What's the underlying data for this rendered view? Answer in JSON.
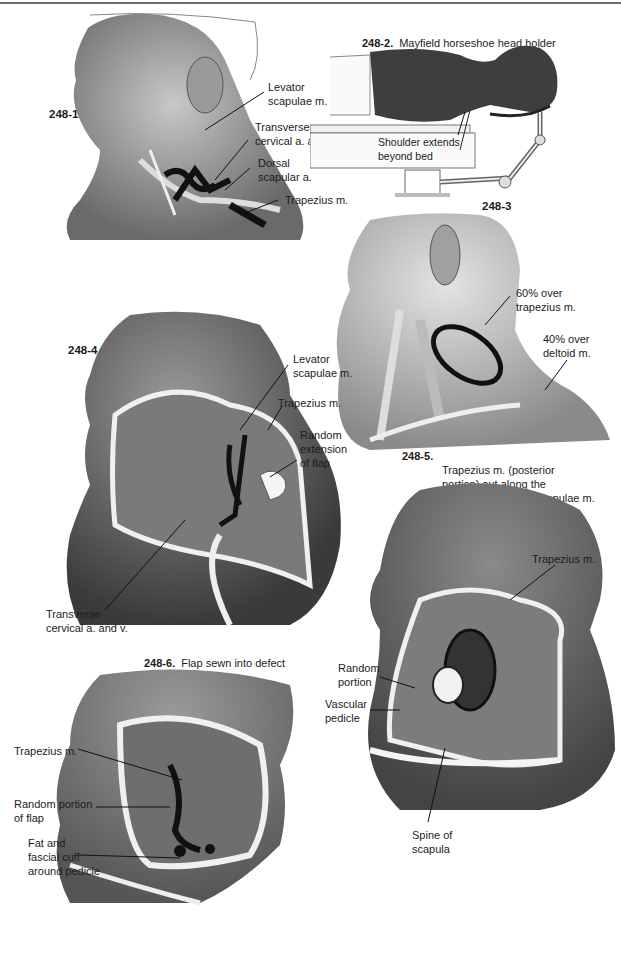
{
  "figures": [
    {
      "id": "248-1",
      "number": "248-1",
      "labels": [
        "Levator\nscapulae m.",
        "Transverse\ncervical a. and v.",
        "Dorsal\nscapular a.",
        "Trapezius m."
      ]
    },
    {
      "id": "248-2",
      "number": "248-2.",
      "caption": "Mayfield horseshoe head holder",
      "labels": [
        "Shoulder extends\nbeyond bed"
      ]
    },
    {
      "id": "248-3",
      "number": "248-3",
      "labels": [
        "60% over\ntrapezius m.",
        "40% over\ndeltoid m."
      ]
    },
    {
      "id": "248-4",
      "number": "248-4",
      "labels": [
        "Levator\nscapulae m.",
        "Trapezius m.",
        "Random\nextension\nof flap",
        "Transverse\ncervical a. and v."
      ]
    },
    {
      "id": "248-5",
      "number": "248-5.",
      "caption": "Trapezius m. (posterior\nportion) out along the\n\"run\" of the levator scapulae m.",
      "labels": [
        "Trapezius m.",
        "Random\nportion",
        "Vascular\npedicle",
        "Spine of\nscapula"
      ]
    },
    {
      "id": "248-6",
      "number": "248-6.",
      "caption": "Flap sewn into defect",
      "labels": [
        "Trapezius m.",
        "Random portion\nof flap",
        "Fat and\nfascial cuff\naround pedicle"
      ]
    }
  ]
}
